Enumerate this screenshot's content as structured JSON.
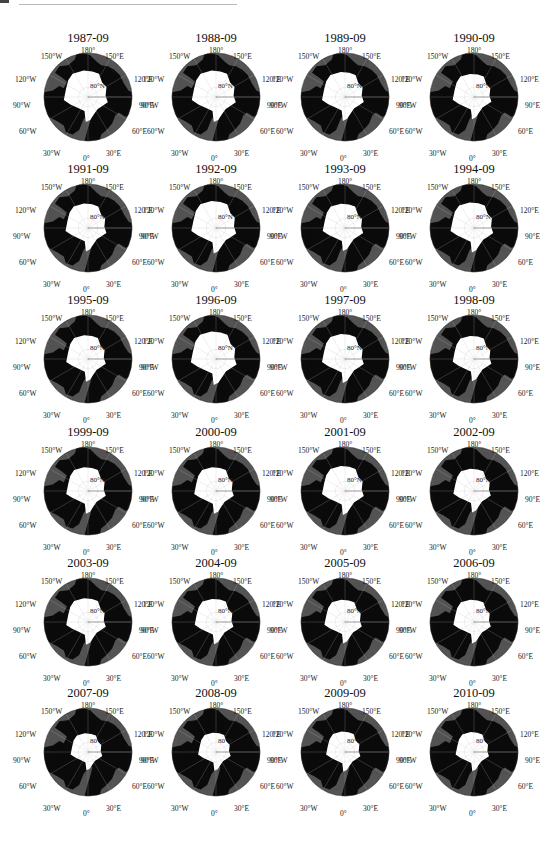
{
  "figure": {
    "layout": {
      "columns": 4,
      "rows": 6
    },
    "colors": {
      "ocean": "#545454",
      "land": "#0b0b0b",
      "ice": "#ffffff",
      "graticule": "#bdbdbd",
      "background": "#ffffff"
    },
    "graticule_labels": {
      "top": "180°",
      "top_left": "150°W",
      "top_right": "150°E",
      "upper_left": "120°W",
      "upper_right": "120°E",
      "left": "90°W",
      "right": "90°E",
      "lower_left": "60°W",
      "lower_right": "60°E",
      "bottom_left": "30°W",
      "bottom_right": "30°E",
      "bottom": "0°",
      "center_lat": "80°N"
    },
    "panels": [
      {
        "title": "1987-09",
        "ice_scale": 1.0
      },
      {
        "title": "1988-09",
        "ice_scale": 1.0
      },
      {
        "title": "1989-09",
        "ice_scale": 0.95
      },
      {
        "title": "1990-09",
        "ice_scale": 0.88
      },
      {
        "title": "1991-09",
        "ice_scale": 0.93
      },
      {
        "title": "1992-09",
        "ice_scale": 1.02
      },
      {
        "title": "1993-09",
        "ice_scale": 0.92
      },
      {
        "title": "1994-09",
        "ice_scale": 0.97
      },
      {
        "title": "1995-09",
        "ice_scale": 0.9
      },
      {
        "title": "1996-09",
        "ice_scale": 1.04
      },
      {
        "title": "1997-09",
        "ice_scale": 0.95
      },
      {
        "title": "1998-09",
        "ice_scale": 0.88
      },
      {
        "title": "1999-09",
        "ice_scale": 0.9
      },
      {
        "title": "2000-09",
        "ice_scale": 0.9
      },
      {
        "title": "2001-09",
        "ice_scale": 0.95
      },
      {
        "title": "2002-09",
        "ice_scale": 0.85
      },
      {
        "title": "2003-09",
        "ice_scale": 0.9
      },
      {
        "title": "2004-09",
        "ice_scale": 0.88
      },
      {
        "title": "2005-09",
        "ice_scale": 0.85
      },
      {
        "title": "2006-09",
        "ice_scale": 0.85
      },
      {
        "title": "2007-09",
        "ice_scale": 0.72
      },
      {
        "title": "2008-09",
        "ice_scale": 0.74
      },
      {
        "title": "2009-09",
        "ice_scale": 0.78
      },
      {
        "title": "2010-09",
        "ice_scale": 0.76
      }
    ]
  }
}
